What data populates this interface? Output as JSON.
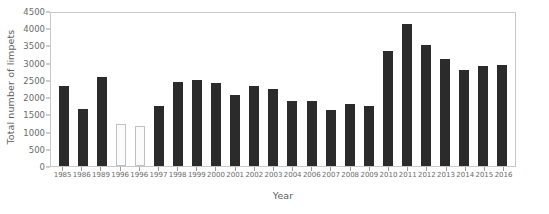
{
  "chart_data": {
    "type": "bar",
    "title": "",
    "xlabel": "Year",
    "ylabel": "Total number of limpets",
    "ylim": [
      0,
      4500
    ],
    "ytick_step": 500,
    "yticks": [
      0,
      500,
      1000,
      1500,
      2000,
      2500,
      3000,
      3500,
      4000,
      4500
    ],
    "grid": false,
    "legend": null,
    "categories": [
      "1985",
      "1986",
      "1989",
      "1996",
      "1996",
      "1997",
      "1998",
      "1999",
      "2000",
      "2001",
      "2002",
      "2003",
      "2004",
      "2006",
      "2007",
      "2008",
      "2009",
      "2010",
      "2011",
      "2012",
      "2013",
      "2014",
      "2015",
      "2016"
    ],
    "values": [
      2330,
      1660,
      2570,
      1210,
      1170,
      1740,
      2450,
      2510,
      2400,
      2070,
      2310,
      2230,
      1900,
      1900,
      1620,
      1810,
      1730,
      3350,
      4120,
      3500,
      3100,
      2800,
      2900,
      2920
    ],
    "bar_styles": [
      "filled",
      "filled",
      "filled",
      "hollow",
      "hollow",
      "filled",
      "filled",
      "filled",
      "filled",
      "filled",
      "filled",
      "filled",
      "filled",
      "filled",
      "filled",
      "filled",
      "filled",
      "filled",
      "filled",
      "filled",
      "filled",
      "filled",
      "filled",
      "filled"
    ],
    "colors": {
      "bar_filled": "#2b2b2b",
      "bar_hollow_fill": "#fbfbfb",
      "bar_hollow_stroke": "#c0c0c0",
      "axis_text": "#6a6a6a",
      "axis_title": "#5e5e5e",
      "frame": "#c8c8c8",
      "background": "#ffffff"
    }
  }
}
